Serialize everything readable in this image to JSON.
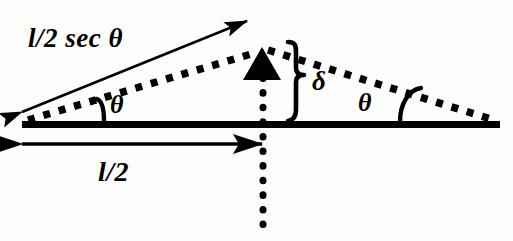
{
  "figure": {
    "background_color": "#fdfdfb",
    "ink_color": "#000000",
    "labels": {
      "hypotenuse": "l/2 sec θ",
      "half_length": "l/2",
      "angle_left": "θ",
      "angle_right": "θ",
      "sag": "δ"
    },
    "elements": {
      "baseline_name": "horizontal-baseline",
      "apex_marker_name": "apex-arrowhead",
      "dotted_left_name": "dotted-segment-left",
      "dotted_right_name": "dotted-segment-right",
      "dotted_vertical_name": "dotted-vertical-line",
      "hyp_arrow_name": "hypotenuse-double-arrow",
      "base_arrow_name": "half-length-double-arrow",
      "brace_name": "sag-brace",
      "arc_left_name": "angle-arc-left",
      "arc_right_name": "angle-arc-right"
    }
  }
}
